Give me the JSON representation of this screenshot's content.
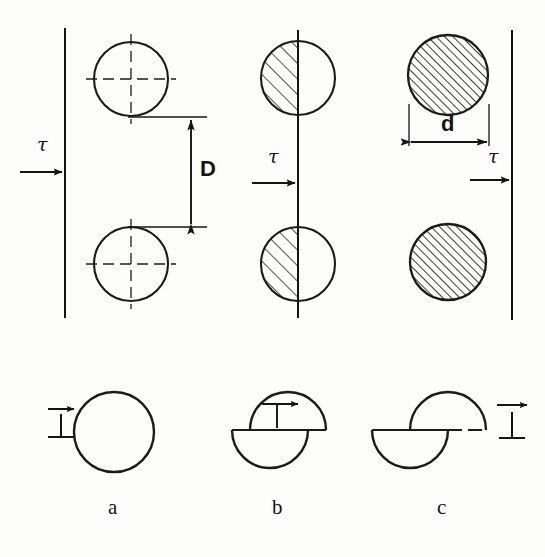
{
  "figure": {
    "background_color": "#fdfdfb",
    "ink_color": "#141414",
    "top_row": {
      "panels": [
        {
          "id": "panel-a-top",
          "name": "unsheared-particles",
          "stress_label": "τ",
          "dimension_label": "D",
          "circle_fill": "none",
          "center_lines": "dash-dot"
        },
        {
          "id": "panel-b-top",
          "name": "partially-sheared-particles",
          "stress_label": "τ",
          "circle_fill": "half-hatched-left"
        },
        {
          "id": "panel-c-top",
          "name": "fully-sheared-particles",
          "stress_label": "τ",
          "dimension_label": "d",
          "circle_fill": "full-hatched"
        }
      ]
    },
    "bottom_row": {
      "panels": [
        {
          "id": "panel-a-bottom",
          "caption": "a",
          "name": "intact-particle",
          "dislocation_symbol": "⊥",
          "shear_offset_px": 0
        },
        {
          "id": "panel-b-bottom",
          "caption": "b",
          "name": "particle-partially-sheared",
          "dislocation_symbol": "⊥",
          "shear_offset_px": 18
        },
        {
          "id": "panel-c-bottom",
          "caption": "c",
          "name": "particle-fully-sheared",
          "dislocation_symbol": "⊥",
          "shear_offset_px": 38
        }
      ]
    },
    "labels": {
      "tau_left": "τ",
      "tau_middle": "τ",
      "tau_right": "τ",
      "dim_D": "D",
      "dim_d": "d",
      "caption_a": "a",
      "caption_b": "b",
      "caption_c": "c"
    }
  }
}
